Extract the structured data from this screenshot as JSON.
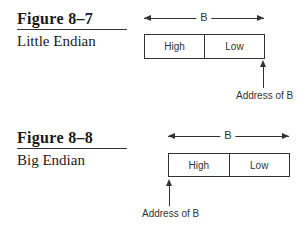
{
  "figures": [
    {
      "number": "Figure 8–7",
      "caption": "Little Endian",
      "width_label": "B",
      "cells": [
        "High",
        "Low"
      ],
      "address_label": "Address of B",
      "address_points_to": "Low"
    },
    {
      "number": "Figure 8–8",
      "caption": "Big Endian",
      "width_label": "B",
      "cells": [
        "High",
        "Low"
      ],
      "address_label": "Address of B",
      "address_points_to": "High"
    }
  ]
}
